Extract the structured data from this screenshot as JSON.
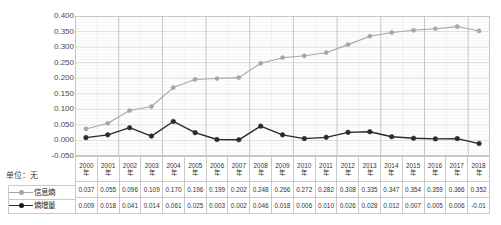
{
  "chart_data": {
    "type": "line",
    "title": "",
    "subtitle": "",
    "xlabel": "",
    "ylabel": "",
    "unit_label": "单位：无",
    "grid": true,
    "legend_position": "bottom-left-table",
    "ylim": [
      -0.05,
      0.4
    ],
    "yticks": [
      "0.400",
      "0.350",
      "0.300",
      "0.250",
      "0.200",
      "0.150",
      "0.100",
      "0.050",
      "0.000",
      "-0.050"
    ],
    "ytick_values": [
      0.4,
      0.35,
      0.3,
      0.25,
      0.2,
      0.15,
      0.1,
      0.05,
      0.0,
      -0.05
    ],
    "categories": [
      "2000年",
      "2001年",
      "2002年",
      "2003年",
      "2004年",
      "2005年",
      "2006年",
      "2007年",
      "2008年",
      "2009年",
      "2010年",
      "2011年",
      "2012年",
      "2013年",
      "2014年",
      "2015年",
      "2016年",
      "2017年",
      "2018年"
    ],
    "category_years": [
      "2000",
      "2001",
      "2002",
      "2003",
      "2004",
      "2005",
      "2006",
      "2007",
      "2008",
      "2009",
      "2010",
      "2011",
      "2012",
      "2013",
      "2014",
      "2015",
      "2016",
      "2017",
      "2018"
    ],
    "year_suffix": "年",
    "series": [
      {
        "name": "信息熵",
        "color": "#a6a6a6",
        "marker": "circle",
        "values": [
          0.037,
          0.055,
          0.096,
          0.109,
          0.17,
          0.196,
          0.199,
          0.202,
          0.248,
          0.266,
          0.272,
          0.282,
          0.308,
          0.335,
          0.347,
          0.354,
          0.359,
          0.366,
          0.352
        ],
        "labels": [
          "0.037",
          "0.055",
          "0.096",
          "0.109",
          "0.170",
          "0.196",
          "0.199",
          "0.202",
          "0.248",
          "0.266",
          "0.272",
          "0.282",
          "0.308",
          "0.335",
          "0.347",
          "0.354",
          "0.359",
          "0.366",
          "0.352"
        ]
      },
      {
        "name": "熵增量",
        "color": "#2a2a2a",
        "marker": "circle",
        "values": [
          0.009,
          0.018,
          0.041,
          0.014,
          0.061,
          0.025,
          0.003,
          0.002,
          0.046,
          0.018,
          0.006,
          0.01,
          0.026,
          0.028,
          0.012,
          0.007,
          0.005,
          0.006,
          -0.01
        ],
        "labels": [
          "0.009",
          "0.018",
          "0.041",
          "0.014",
          "0.061",
          "0.025",
          "0.003",
          "0.002",
          "0.046",
          "0.018",
          "0.006",
          "0.010",
          "0.026",
          "0.028",
          "0.012",
          "0.007",
          "0.005",
          "0.006",
          "-0.01"
        ]
      }
    ]
  }
}
